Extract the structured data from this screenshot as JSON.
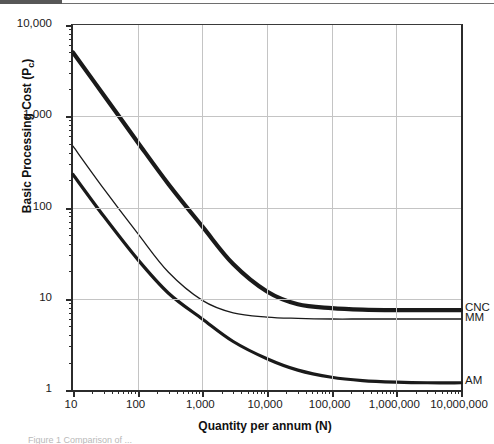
{
  "figure": {
    "caption_sliver": "Figure 1  Comparison of ..."
  },
  "axes": {
    "y_title_main": "Basic Processing Cost (P",
    "y_title_sub": "c",
    "y_title_close": ")",
    "x_title": "Quantity per annum (N)",
    "y_ticks": [
      "1",
      "10",
      "100",
      "1,000",
      "10,000"
    ],
    "x_ticks": [
      "10",
      "100",
      "1,000",
      "10,000",
      "100,000",
      "1,000,000",
      "10,000,000"
    ]
  },
  "series_labels": {
    "cnc": "CNC",
    "mm": "MM",
    "am": "AM"
  },
  "chart_data": {
    "type": "line",
    "title": "",
    "xlabel": "Quantity per annum (N)",
    "ylabel": "Basic Processing Cost (Pc)",
    "xscale": "log",
    "yscale": "log",
    "xlim": [
      10,
      10000000
    ],
    "ylim": [
      1,
      10000
    ],
    "grid": true,
    "legend_position": "right-inline-end-labels",
    "x_tick_labels": [
      "10",
      "100",
      "1,000",
      "10,000",
      "100,000",
      "1,000,000",
      "10,000,000"
    ],
    "y_tick_labels": [
      "1",
      "10",
      "100",
      "1,000",
      "10,000"
    ],
    "series": [
      {
        "name": "CNC",
        "stroke": "#1a1a1a",
        "width": 4.2,
        "x": [
          10,
          30,
          100,
          300,
          1000,
          3000,
          10000,
          30000,
          100000,
          300000,
          1000000,
          3000000,
          10000000
        ],
        "y": [
          5000,
          1700,
          520,
          180,
          62,
          24,
          12.0,
          8.7,
          7.9,
          7.6,
          7.5,
          7.5,
          7.5
        ]
      },
      {
        "name": "MM",
        "stroke": "#1a1a1a",
        "width": 1.3,
        "x": [
          10,
          30,
          100,
          300,
          1000,
          3000,
          10000,
          30000,
          100000,
          300000,
          1000000,
          3000000,
          10000000
        ],
        "y": [
          470,
          160,
          52,
          19.5,
          9.6,
          7.0,
          6.3,
          6.1,
          6.0,
          6.0,
          6.0,
          6.0,
          6.0
        ]
      },
      {
        "name": "AM",
        "stroke": "#1a1a1a",
        "width": 3.2,
        "x": [
          10,
          30,
          100,
          300,
          1000,
          3000,
          10000,
          30000,
          100000,
          300000,
          1000000,
          3000000,
          10000000
        ],
        "y": [
          230,
          80,
          27,
          11.5,
          6.0,
          3.4,
          2.2,
          1.65,
          1.38,
          1.27,
          1.22,
          1.2,
          1.2
        ]
      }
    ]
  }
}
